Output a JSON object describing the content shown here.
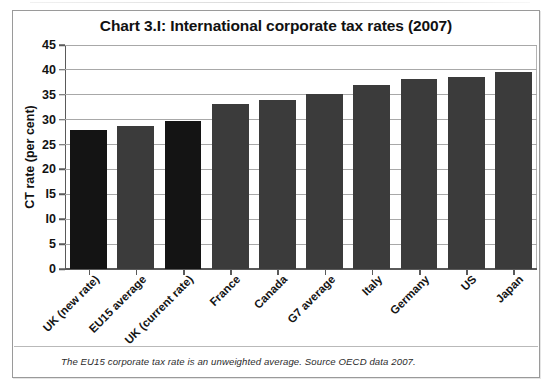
{
  "figure": {
    "title": "Chart 3.I: International corporate tax rates (2007)",
    "footnote": "The EU15 corporate tax rate is an unweighted average. Source OECD data 2007."
  },
  "chart_data": {
    "type": "bar",
    "title": "Chart 3.I: International corporate tax rates (2007)",
    "xlabel": "",
    "ylabel": "CT rate (per cent)",
    "ylim": [
      0,
      45
    ],
    "ytick_step": 5,
    "yticks": [
      "0",
      "5",
      "I0",
      "I5",
      "20",
      "25",
      "30",
      "35",
      "40",
      "45"
    ],
    "ytick_values": [
      0,
      5,
      10,
      15,
      20,
      25,
      30,
      35,
      40,
      45
    ],
    "grid": true,
    "legend": "none",
    "categories": [
      "UK (new rate)",
      "EU15 average",
      "UK (current rate)",
      "France",
      "Canada",
      "G7 average",
      "Italy",
      "Germany",
      "US",
      "Japan"
    ],
    "values": [
      28.0,
      28.8,
      29.8,
      33.1,
      34.0,
      35.2,
      37.0,
      38.2,
      38.6,
      39.5
    ],
    "bar_colors": [
      "#141414",
      "#3b3b3b",
      "#141414",
      "#3b3b3b",
      "#3b3b3b",
      "#3b3b3b",
      "#3b3b3b",
      "#3b3b3b",
      "#3b3b3b",
      "#3b3b3b"
    ],
    "highlight_color": "#141414",
    "series_color": "#3b3b3b",
    "axis_color": "#5a5a5a",
    "grid_color": "#a8a8a8"
  }
}
